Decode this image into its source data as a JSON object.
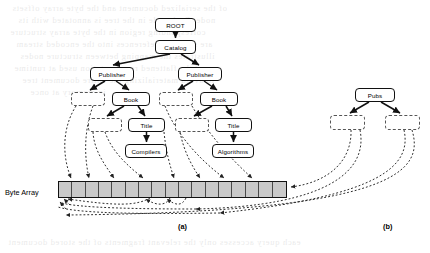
{
  "figure": {
    "captions": [
      {
        "id": "caption-a",
        "label": "(a)",
        "x": 178,
        "y": 222
      },
      {
        "id": "caption-b",
        "label": "(b)",
        "x": 383,
        "y": 222
      }
    ],
    "byte_array": {
      "label": "Byte Array",
      "label_x": 5,
      "label_y": 188,
      "x": 58,
      "y": 181,
      "width": 229,
      "height": 17,
      "cell_count": 17,
      "fill_color": "#c9c9c9",
      "border_color": "#111111"
    },
    "panel_a": {
      "name": "xml-dom-tree",
      "solid_nodes": [
        {
          "id": "root",
          "label": "ROOT",
          "x": 155,
          "y": 18,
          "w": 41,
          "h": 14
        },
        {
          "id": "catalog",
          "label": "Catalog",
          "x": 155,
          "y": 40,
          "w": 41,
          "h": 14
        },
        {
          "id": "publisher1",
          "label": "Publisher",
          "x": 90,
          "y": 67,
          "w": 44,
          "h": 14
        },
        {
          "id": "publisher2",
          "label": "Publisher",
          "x": 178,
          "y": 67,
          "w": 44,
          "h": 14
        },
        {
          "id": "book1",
          "label": "Book",
          "x": 112,
          "y": 92,
          "w": 38,
          "h": 14
        },
        {
          "id": "book2",
          "label": "Book",
          "x": 200,
          "y": 92,
          "w": 38,
          "h": 14
        },
        {
          "id": "title1",
          "label": "Title",
          "x": 128,
          "y": 118,
          "w": 37,
          "h": 14
        },
        {
          "id": "title2",
          "label": "Title",
          "x": 215,
          "y": 118,
          "w": 37,
          "h": 14
        },
        {
          "id": "compilers",
          "label": "Compilers",
          "x": 125,
          "y": 144,
          "w": 42,
          "h": 14
        },
        {
          "id": "algorithms",
          "label": "Algorithms",
          "x": 212,
          "y": 144,
          "w": 42,
          "h": 14
        }
      ],
      "dashed_nodes": [
        {
          "id": "placeholder-a1",
          "x": 71,
          "y": 92,
          "w": 34,
          "h": 14
        },
        {
          "id": "placeholder-a2",
          "x": 159,
          "y": 92,
          "w": 34,
          "h": 14
        },
        {
          "id": "placeholder-a3",
          "x": 88,
          "y": 118,
          "w": 34,
          "h": 14
        },
        {
          "id": "placeholder-a4",
          "x": 175,
          "y": 118,
          "w": 34,
          "h": 14
        }
      ]
    },
    "panel_b": {
      "name": "pubs-tree",
      "solid_nodes": [
        {
          "id": "pubs",
          "label": "Pubs",
          "x": 355,
          "y": 88,
          "w": 40,
          "h": 14
        }
      ],
      "dashed_nodes": [
        {
          "id": "placeholder-b1",
          "x": 330,
          "y": 115,
          "w": 35,
          "h": 15
        },
        {
          "id": "placeholder-b2",
          "x": 385,
          "y": 115,
          "w": 35,
          "h": 15
        }
      ]
    }
  },
  "ghost_text": {
    "lines": [
      {
        "text": "of the serialized document and the byte array offsets",
        "x": 12,
        "y": 2
      },
      {
        "text": "node. Each node in the tree is annotated with its",
        "x": 18,
        "y": 14
      },
      {
        "text": "corresponding region in the byte array structure",
        "x": 10,
        "y": 26
      },
      {
        "text": "are stored as references into the encoded stream",
        "x": 16,
        "y": 38
      },
      {
        "text": "illustrates the mapping between structure nodes",
        "x": 20,
        "y": 50
      },
      {
        "text": "and the flattened representation used at runtime",
        "x": 14,
        "y": 62
      },
      {
        "text": "to avoid materializing the entire document tree",
        "x": 22,
        "y": 74
      },
      {
        "text": "in memory at once",
        "x": 30,
        "y": 86
      },
      {
        "text": "each query accesses only the relevant fragments of the stored document",
        "x": 8,
        "y": 236
      }
    ]
  }
}
